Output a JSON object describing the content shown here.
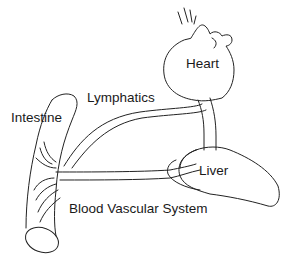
{
  "diagram": {
    "labels": {
      "heart": "Heart",
      "lymphatics": "Lymphatics",
      "intestine": "Intestine",
      "liver": "Liver",
      "blood_vascular_system": "Blood Vascular System"
    },
    "colors": {
      "stroke": "#222222",
      "background": "#ffffff",
      "text": "#1a1a1a"
    }
  }
}
